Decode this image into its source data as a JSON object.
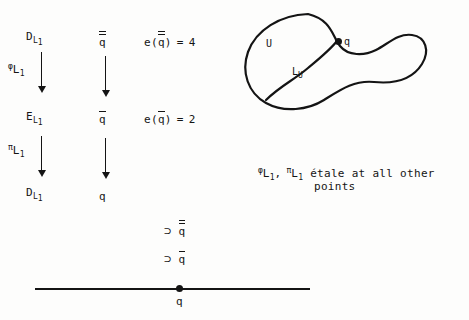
{
  "figure": {
    "title_hidden": "",
    "left_column": {
      "top_object": {
        "base": "D",
        "sub": "L",
        "sub_index": "1",
        "full": "D_L1"
      },
      "middle_object": {
        "base": "E",
        "sub": "L",
        "sub_index": "1",
        "full": "E_L1"
      },
      "bottom_object": {
        "base": "D",
        "sub": "L",
        "sub_index": "1",
        "full": "D_L1"
      },
      "upper_map": {
        "symbol": "φ",
        "sub": "L",
        "sub_index": "1",
        "full": "φ_L1"
      },
      "lower_map": {
        "symbol": "π",
        "sub": "L",
        "sub_index": "1",
        "full": "π_L1"
      }
    },
    "middle_column": {
      "top_prime": "q",
      "top_prime_bars": 2,
      "middle_prime": "q",
      "middle_prime_bars": 1,
      "bottom_prime": "q",
      "bottom_prime_bars": 0
    },
    "right_column": {
      "top_equation": {
        "fn": "e",
        "open": "(",
        "arg": "q",
        "arg_bars": 2,
        "close": ")",
        "eq": "=",
        "value": "4"
      },
      "middle_equation": {
        "fn": "e",
        "open": "(",
        "arg": "q",
        "arg_bars": 1,
        "close": ")",
        "eq": "=",
        "value": "2"
      }
    },
    "containment_chain": [
      {
        "symbol": "⊃",
        "elem": "q",
        "bars": 2
      },
      {
        "symbol": "⊃",
        "elem": "q",
        "bars": 1
      }
    ],
    "number_line": {
      "point_label": "q"
    },
    "blob": {
      "region_label": "U",
      "sheaf_label": {
        "base": "L",
        "sub": "U",
        "full": "L_U"
      },
      "point_label": "q"
    },
    "note": {
      "map1": {
        "symbol": "φ",
        "sub": "L",
        "sub_index": "1"
      },
      "comma": ",",
      "map2": {
        "symbol": "π",
        "sub": "L",
        "sub_index": "1"
      },
      "line1": "étale at all other",
      "line2": "points"
    }
  },
  "colors": {
    "ink": "#141414",
    "paper": "#fdfdfc"
  }
}
